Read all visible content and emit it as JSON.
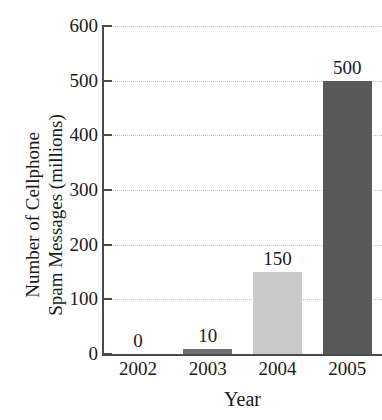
{
  "chart_data": {
    "type": "bar",
    "title": "",
    "title_remnant": "",
    "xlabel": "Year",
    "ylabel_line1": "Number of Cellphone",
    "ylabel_line2": "Spam Messages (millions)",
    "categories": [
      "2002",
      "2003",
      "2004",
      "2005"
    ],
    "values": [
      0,
      10,
      150,
      500
    ],
    "value_labels": [
      "0",
      "10",
      "150",
      "500"
    ],
    "bar_colors": [
      "#ffffff",
      "#6e6e6e",
      "#c9c9c9",
      "#595959"
    ],
    "ylim": [
      0,
      600
    ],
    "ytick_values": [
      0,
      100,
      200,
      300,
      400,
      500,
      600
    ],
    "ytick_labels": [
      "0",
      "100",
      "200",
      "300",
      "400",
      "500",
      "600"
    ],
    "grid": true,
    "grid_color": "#c3c3c3",
    "axis_color": "#4a4a4a",
    "legend": "none",
    "background": "#ffffff"
  }
}
